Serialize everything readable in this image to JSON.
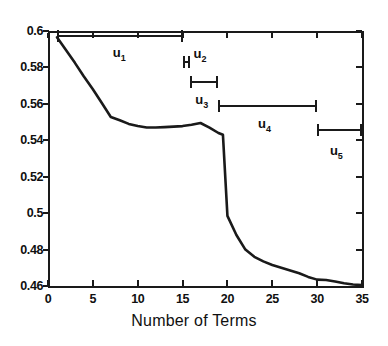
{
  "chart_data": {
    "type": "line",
    "title": "",
    "subtitle": "",
    "xlabel": "Number of Terms",
    "ylabel": "",
    "xlim": [
      0,
      35
    ],
    "ylim": [
      0.46,
      0.6
    ],
    "xticks": [
      0,
      5,
      10,
      15,
      20,
      25,
      30,
      35
    ],
    "yticks": [
      0.46,
      0.48,
      0.5,
      0.52,
      0.54,
      0.56,
      0.58,
      0.6
    ],
    "xtick_labels": [
      "0",
      "5",
      "10",
      "15",
      "20",
      "25",
      "30",
      "35"
    ],
    "ytick_labels": [
      "0.46",
      "0.48",
      "0.5",
      "0.52",
      "0.54",
      "0.56",
      "0.58",
      "0.6"
    ],
    "grid": false,
    "legend": null,
    "series": [
      {
        "name": "error",
        "x": [
          1,
          2,
          3,
          4,
          5,
          6,
          7,
          8,
          9,
          10,
          11,
          12,
          13,
          14,
          15,
          16,
          17,
          18,
          19,
          19.5,
          20,
          21,
          22,
          23,
          24,
          25,
          26,
          27,
          28,
          29,
          30,
          31,
          32,
          33,
          34,
          35
        ],
        "y": [
          0.5965,
          0.5895,
          0.5825,
          0.575,
          0.568,
          0.5605,
          0.5528,
          0.551,
          0.549,
          0.5478,
          0.547,
          0.547,
          0.5472,
          0.5475,
          0.5478,
          0.5485,
          0.5495,
          0.547,
          0.544,
          0.543,
          0.4985,
          0.488,
          0.48,
          0.476,
          0.4735,
          0.4715,
          0.47,
          0.4685,
          0.467,
          0.465,
          0.4635,
          0.4633,
          0.4625,
          0.4615,
          0.4608,
          0.4605
        ]
      }
    ],
    "annotations": [
      {
        "label": "u",
        "sub": "1",
        "x_start": 1,
        "x_end": 15,
        "y": 0.5975,
        "label_x": 8,
        "label_y": 0.588
      },
      {
        "label": "u",
        "sub": "2",
        "x_start": 15,
        "x_end": 15.8,
        "y": 0.583,
        "label_x": 17,
        "label_y": 0.5875
      },
      {
        "label": "u",
        "sub": "3",
        "x_start": 15.8,
        "x_end": 19,
        "y": 0.572,
        "label_x": 17.2,
        "label_y": 0.562
      },
      {
        "label": "u",
        "sub": "4",
        "x_start": 19,
        "x_end": 30,
        "y": 0.559,
        "label_x": 24.2,
        "label_y": 0.549
      },
      {
        "label": "u",
        "sub": "5",
        "x_start": 30,
        "x_end": 35,
        "y": 0.5455,
        "label_x": 32.2,
        "label_y": 0.534
      }
    ]
  },
  "style": {
    "line_color": "#1a1a1a",
    "axis_color": "#1a1a1a",
    "background": "#ffffff",
    "text_color": "#101010"
  }
}
